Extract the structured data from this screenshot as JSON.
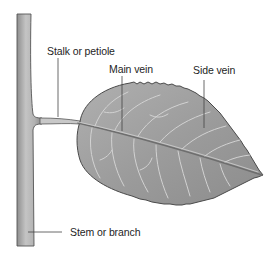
{
  "diagram": {
    "colors": {
      "leaf_fill": "#9a9a9a",
      "leaf_edge": "#4a4a4a",
      "vein": "#d0d0d0",
      "stem_fill": "#b4b4b4",
      "stem_edge": "#555555",
      "leader_line": "#444444",
      "text": "#1e1e1e"
    },
    "labels": [
      {
        "id": "petiole",
        "text": "Stalk or petiole"
      },
      {
        "id": "main-vein",
        "text": "Main vein"
      },
      {
        "id": "side-vein",
        "text": "Side vein"
      },
      {
        "id": "stem",
        "text": "Stem or branch"
      }
    ]
  }
}
